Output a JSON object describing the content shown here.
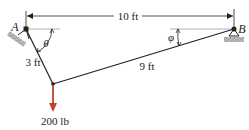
{
  "diagram": {
    "type": "statics-cable",
    "points": {
      "A": {
        "label": "A",
        "x": 26,
        "y": 29
      },
      "B": {
        "label": "B",
        "x": 234,
        "y": 29
      },
      "C": {
        "x": 53,
        "y": 84
      }
    },
    "span": {
      "label": "10 ft"
    },
    "segments": [
      {
        "from": "A",
        "to": "C",
        "label": "3 ft"
      },
      {
        "from": "C",
        "to": "B",
        "label": "9 ft"
      }
    ],
    "angles": [
      {
        "at": "A",
        "symbol": "θ"
      },
      {
        "at": "B",
        "symbol": "φ"
      }
    ],
    "load": {
      "at": "C",
      "label": "200 lb",
      "color": "#c0442a"
    },
    "colors": {
      "line": "#222222",
      "support_fill": "#a8a8a8",
      "reference_line": "#b0b0b0"
    }
  }
}
